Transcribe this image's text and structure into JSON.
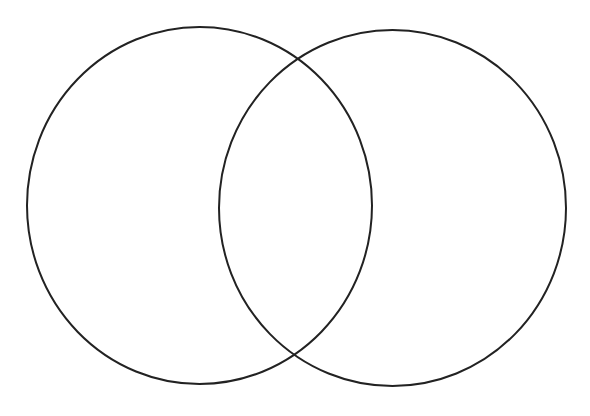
{
  "diagram": {
    "type": "venn",
    "background": "#ffffff",
    "stroke_color": "#222222",
    "stroke_width": 2,
    "circles": [
      {
        "name": "left-circle",
        "cx": 199.5,
        "cy": 205.5,
        "rx": 172.5,
        "ry": 178.5,
        "label": ""
      },
      {
        "name": "right-circle",
        "cx": 392.5,
        "cy": 208,
        "rx": 173.5,
        "ry": 178,
        "label": ""
      }
    ]
  }
}
